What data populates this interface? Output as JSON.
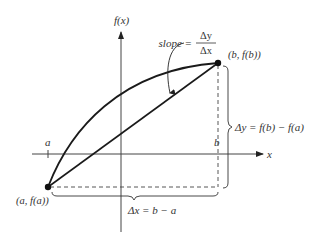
{
  "figure": {
    "axes": {
      "y_label": "f(x)",
      "x_label": "x"
    },
    "ticks": {
      "a": "a",
      "b": "b"
    },
    "points": {
      "A": "(a, f(a))",
      "B": "(b, f(b))"
    },
    "slope": {
      "prefix": "slope =",
      "numerator": "Δy",
      "denominator": "Δx"
    },
    "delta_y_label": "Δy = f(b) − f(a)",
    "delta_x_label": "Δx = b − a",
    "colors": {
      "curve": "#1a1a1a",
      "axis": "#444444",
      "text": "#333333"
    }
  }
}
